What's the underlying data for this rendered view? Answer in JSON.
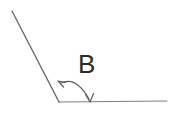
{
  "figure": {
    "name": "angle-diagram",
    "kind": "geometry-angle-figure",
    "background_color": "#ffffff",
    "width": 174,
    "height": 117,
    "label": {
      "text": "B",
      "color": "#2b2b2b",
      "x": 78,
      "y": 73,
      "font_size": 26
    },
    "vertex": {
      "x": 59,
      "y": 102
    },
    "rays": [
      {
        "name": "diagonal-ray",
        "from_x": 12,
        "from_y": 11,
        "to_x": 59,
        "to_y": 102,
        "color": "#6a6a6a",
        "stroke_width": 1.4
      },
      {
        "name": "horizontal-ray",
        "from_x": 59,
        "from_y": 102,
        "to_x": 167,
        "to_y": 101,
        "color": "#7d7d7d",
        "stroke_width": 1.1
      }
    ],
    "angle_arc": {
      "name": "angle-arc",
      "color": "#5e5e5e",
      "stroke_width": 1.2,
      "start_x": 61,
      "start_y": 83,
      "control_x": 76,
      "control_y": 76,
      "end_x": 89,
      "end_y": 99,
      "double_headed": true,
      "arrowheads": [
        {
          "name": "arc-arrowhead-start",
          "tip_x": 58,
          "tip_y": 81,
          "direction": "up-left"
        },
        {
          "name": "arc-arrowhead-end",
          "tip_x": 90,
          "tip_y": 102,
          "direction": "down"
        }
      ]
    }
  }
}
